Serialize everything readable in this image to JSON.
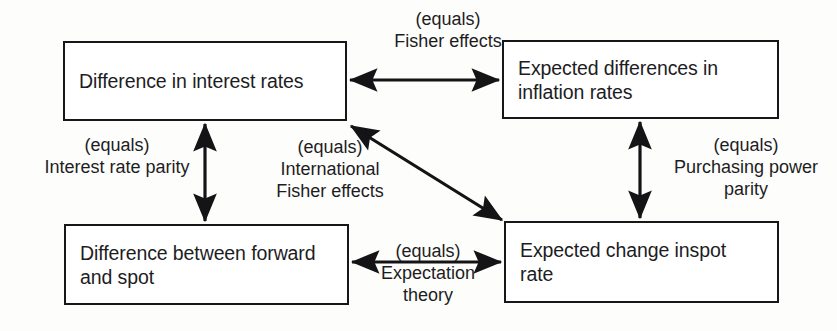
{
  "diagram": {
    "type": "flow-diagram",
    "colors": {
      "background": "#fdfdfc",
      "box_border": "#17171a",
      "box_fill": "#ffffff",
      "text": "#1d1d1f",
      "arrow": "#141417"
    },
    "nodes": [
      {
        "id": "interest-rate-difference",
        "label": "Difference in interest rates",
        "x": 63,
        "y": 41,
        "w": 284,
        "h": 80
      },
      {
        "id": "expected-inflation-difference",
        "label": "Expected differences in\ninflation rates",
        "x": 502,
        "y": 40,
        "w": 277,
        "h": 79
      },
      {
        "id": "forward-spot-difference",
        "label": "Difference between forward\nand spot",
        "x": 64,
        "y": 224,
        "w": 285,
        "h": 81
      },
      {
        "id": "expected-spot-change",
        "label": "Expected change inspot\nrate",
        "x": 504,
        "y": 221,
        "w": 275,
        "h": 82
      }
    ],
    "edges": [
      {
        "id": "fisher-effects",
        "from": "interest-rate-difference",
        "to": "expected-inflation-difference",
        "relation": "(equals)",
        "name": "Fisher effects",
        "label": "(equals)\nFisher effects",
        "label_x": 358,
        "label_y": 8,
        "label_w": 180,
        "direction": "bidirectional",
        "orientation": "horizontal"
      },
      {
        "id": "interest-rate-parity",
        "from": "interest-rate-difference",
        "to": "forward-spot-difference",
        "relation": "(equals)",
        "name": "Interest rate parity",
        "label": "(equals)\nInterest rate parity",
        "label_x": 28,
        "label_y": 134,
        "label_w": 178,
        "direction": "bidirectional",
        "orientation": "vertical"
      },
      {
        "id": "international-fisher-effects",
        "from": "interest-rate-difference",
        "to": "expected-spot-change",
        "relation": "(equals)",
        "name": "International Fisher effects",
        "label": "(equals)\nInternational\nFisher effects",
        "label_x": 244,
        "label_y": 136,
        "label_w": 172,
        "direction": "bidirectional",
        "orientation": "diagonal"
      },
      {
        "id": "purchasing-power-parity",
        "from": "expected-inflation-difference",
        "to": "expected-spot-change",
        "relation": "(equals)",
        "name": "Purchasing power parity",
        "label": "(equals)\nPurchasing power\nparity",
        "label_x": 655,
        "label_y": 134,
        "label_w": 182,
        "direction": "bidirectional",
        "orientation": "vertical"
      },
      {
        "id": "expectation-theory",
        "from": "forward-spot-difference",
        "to": "expected-spot-change",
        "relation": "(equals)",
        "name": "Expectation theory",
        "label": "(equals)\nExpectation\ntheory",
        "label_x": 369,
        "label_y": 240,
        "label_w": 118,
        "direction": "bidirectional",
        "orientation": "horizontal"
      }
    ]
  }
}
